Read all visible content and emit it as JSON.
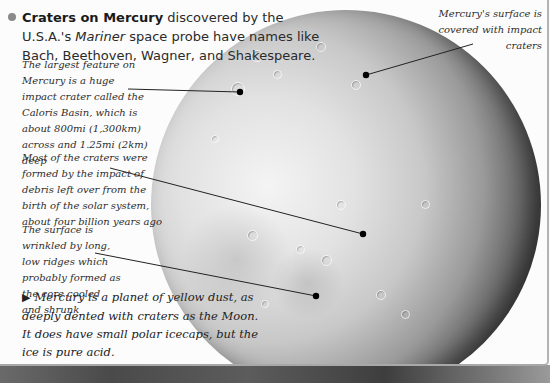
{
  "intro": {
    "highlight": "Craters on Mercury",
    "text_1": " discovered by the U.S.A.'s ",
    "probe_name": "Mariner",
    "text_2": " space probe have names like Bach, Beethoven, Wagner, and Shakespeare."
  },
  "callouts": [
    {
      "id": "caloris",
      "text": "The largest feature on Mercury is a huge impact crater called the Caloris Basin, which is about 800mi (1,300km) across and 1.25mi (2km) deep"
    },
    {
      "id": "debris",
      "text": "Most of the craters were formed by the impact of debris left over from the birth of the solar system, about four billion years ago"
    },
    {
      "id": "wrinkled",
      "text": "The surface is wrinkled by long, low ridges which probably formed as the core cooled and shrunk"
    },
    {
      "id": "surface",
      "text": "Mercury's surface is covered with impact craters"
    }
  ],
  "main_caption": {
    "arrow": "▶",
    "text": "Mercury is a planet of yellow dust, as deeply dented with craters as the Moon. It does have small polar icecaps, but the ice is pure acid."
  },
  "colors": {
    "panel_bg": "#fcfcfc",
    "bullet": "#8a8a8a",
    "text": "#2a2a2a",
    "leader_line": "#222222"
  }
}
